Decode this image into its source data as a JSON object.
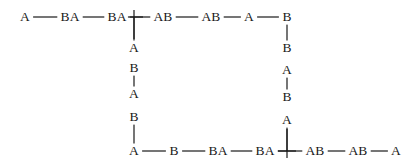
{
  "figure": {
    "type": "node-link-diagram",
    "shape": "rectangular-cycle",
    "background_color": "#ffffff",
    "line_color": "#1a1a1a",
    "text_color": "#1a1a1a",
    "width": 412,
    "height": 165
  },
  "nodes": [
    {
      "id": "t1",
      "label": "A",
      "x": 25,
      "y": 17
    },
    {
      "id": "t2",
      "label": "BA",
      "x": 70,
      "y": 17
    },
    {
      "id": "t3",
      "label": "BA",
      "x": 117,
      "y": 17
    },
    {
      "id": "t4",
      "label": "AB",
      "x": 163,
      "y": 17
    },
    {
      "id": "t5",
      "label": "AB",
      "x": 211,
      "y": 17
    },
    {
      "id": "t6",
      "label": "A",
      "x": 249,
      "y": 17
    },
    {
      "id": "t7",
      "label": "B",
      "x": 287,
      "y": 17
    },
    {
      "id": "l1",
      "label": "A",
      "x": 134,
      "y": 48
    },
    {
      "id": "l2",
      "label": "B",
      "x": 134,
      "y": 68
    },
    {
      "id": "l3",
      "label": "A",
      "x": 134,
      "y": 94
    },
    {
      "id": "l4",
      "label": "B",
      "x": 134,
      "y": 117
    },
    {
      "id": "r1",
      "label": "B",
      "x": 287,
      "y": 48
    },
    {
      "id": "r2",
      "label": "A",
      "x": 287,
      "y": 70
    },
    {
      "id": "r3",
      "label": "B",
      "x": 287,
      "y": 97
    },
    {
      "id": "r4",
      "label": "A",
      "x": 287,
      "y": 120
    },
    {
      "id": "b1",
      "label": "A",
      "x": 134,
      "y": 151
    },
    {
      "id": "b2",
      "label": "B",
      "x": 174,
      "y": 151
    },
    {
      "id": "b3",
      "label": "BA",
      "x": 218,
      "y": 151
    },
    {
      "id": "b4",
      "label": "BA",
      "x": 265,
      "y": 151
    },
    {
      "id": "b5",
      "label": "AB",
      "x": 315,
      "y": 151
    },
    {
      "id": "b6",
      "label": "AB",
      "x": 358,
      "y": 151
    },
    {
      "id": "b7",
      "label": "A",
      "x": 396,
      "y": 151
    }
  ],
  "edges": [
    {
      "from": "t1",
      "to": "t2",
      "orientation": "horizontal"
    },
    {
      "from": "t2",
      "to": "t3",
      "orientation": "horizontal"
    },
    {
      "from": "t3",
      "to": "t4",
      "orientation": "horizontal"
    },
    {
      "from": "t4",
      "to": "t5",
      "orientation": "horizontal"
    },
    {
      "from": "t5",
      "to": "t6",
      "orientation": "horizontal"
    },
    {
      "from": "t6",
      "to": "t7",
      "orientation": "horizontal"
    },
    {
      "from": "junction-top-left",
      "to": "l1",
      "orientation": "vertical"
    },
    {
      "from": "l2",
      "to": "l3",
      "orientation": "vertical"
    },
    {
      "from": "l4",
      "to": "b1",
      "orientation": "vertical"
    },
    {
      "from": "t7",
      "to": "r1",
      "orientation": "vertical"
    },
    {
      "from": "r2",
      "to": "r3",
      "orientation": "vertical"
    },
    {
      "from": "r4",
      "to": "junction-bottom-right",
      "orientation": "vertical"
    },
    {
      "from": "b1",
      "to": "b2",
      "orientation": "horizontal"
    },
    {
      "from": "b2",
      "to": "b3",
      "orientation": "horizontal"
    },
    {
      "from": "b3",
      "to": "b4",
      "orientation": "horizontal"
    },
    {
      "from": "b4",
      "to": "b5",
      "orientation": "horizontal"
    },
    {
      "from": "b5",
      "to": "b6",
      "orientation": "horizontal"
    },
    {
      "from": "b6",
      "to": "b7",
      "orientation": "horizontal"
    }
  ],
  "junctions": [
    {
      "id": "junction-top-left",
      "type": "tee-down",
      "x": 134,
      "y": 17
    },
    {
      "id": "junction-bottom-right",
      "type": "tee-up",
      "x": 287,
      "y": 151
    }
  ]
}
